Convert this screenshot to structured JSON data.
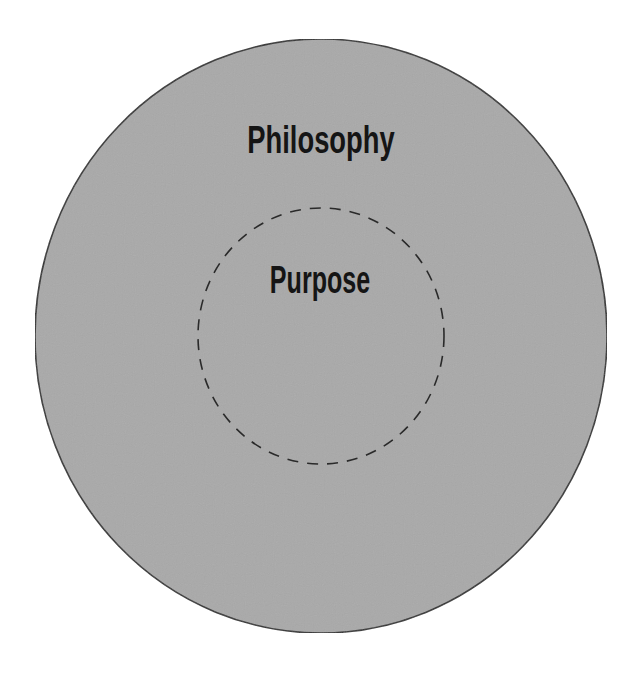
{
  "diagram": {
    "type": "nested-circles",
    "outer": {
      "label": "Philosophy",
      "fill": "#a9a9a9",
      "stroke": "#333333",
      "border_style": "solid"
    },
    "inner": {
      "label": "Purpose",
      "stroke": "#2a2a2a",
      "border_style": "dashed"
    },
    "text_color": "#151515",
    "background": "#ffffff"
  }
}
